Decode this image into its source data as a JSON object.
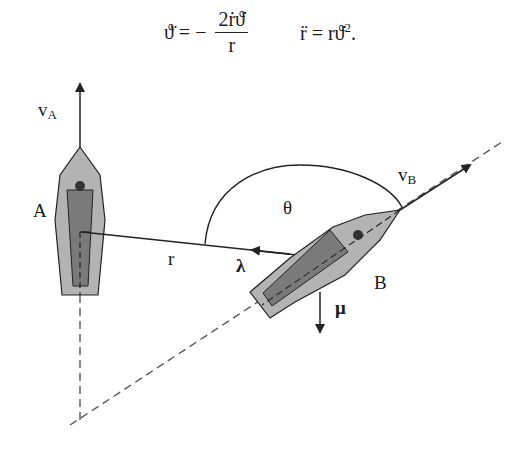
{
  "equations": {
    "eq1_lhs": "ϑ̈ = −",
    "eq1_num": "2ṙϑ̇",
    "eq1_den": "r",
    "eq2": "r̈ = rϑ̇².",
    "eq2_lhs": "r̈ = rϑ̇",
    "eq2_sup": "2",
    "eq2_end": "."
  },
  "labels": {
    "vA_main": "v",
    "vA_sub": "A",
    "vB_main": "v",
    "vB_sub": "B",
    "boatA": "A",
    "boatB": "B",
    "r": "r",
    "theta": "θ",
    "lambda": "λ",
    "mu": "μ"
  },
  "colors": {
    "hull": "#b3b3b3",
    "cabin": "#7a7a7a",
    "line": "#222222",
    "dashed": "#555555"
  }
}
